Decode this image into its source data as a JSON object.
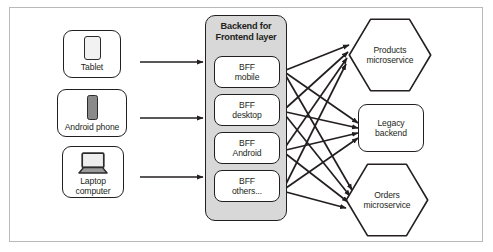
{
  "diagram": {
    "frame_border_color": "#b9b9b9",
    "line_color": "#231f20",
    "layer_fill": "#d8d8d8"
  },
  "clients": [
    {
      "label": "Tablet",
      "icon": "tablet-icon"
    },
    {
      "label": "Android phone",
      "icon": "smartphone-icon"
    },
    {
      "label": "Laptop\ncomputer",
      "icon": "laptop-icon"
    }
  ],
  "bff_layer": {
    "title": "Backend for\nFrontend layer",
    "boxes": [
      {
        "label": "BFF\nmobile"
      },
      {
        "label": "BFF\ndesktop"
      },
      {
        "label": "BFF\nAndroid"
      },
      {
        "label": "BFF\nothers..."
      }
    ]
  },
  "services": [
    {
      "label": "Products\nmicroservice",
      "shape": "hexagon"
    },
    {
      "label": "Legacy\nbackend",
      "shape": "rounded-rectangle"
    },
    {
      "label": "Orders\nmicroservice",
      "shape": "hexagon"
    }
  ],
  "connections": {
    "client_to_layer": [
      {
        "from": "Tablet",
        "to": "Backend for Frontend layer"
      },
      {
        "from": "Android phone",
        "to": "Backend for Frontend layer"
      },
      {
        "from": "Laptop computer",
        "to": "Backend for Frontend layer"
      }
    ],
    "bff_to_service": [
      {
        "from": "BFF mobile",
        "to": "Products microservice"
      },
      {
        "from": "BFF mobile",
        "to": "Legacy backend"
      },
      {
        "from": "BFF mobile",
        "to": "Orders microservice"
      },
      {
        "from": "BFF desktop",
        "to": "Products microservice"
      },
      {
        "from": "BFF desktop",
        "to": "Legacy backend"
      },
      {
        "from": "BFF desktop",
        "to": "Orders microservice"
      },
      {
        "from": "BFF Android",
        "to": "Products microservice"
      },
      {
        "from": "BFF Android",
        "to": "Legacy backend"
      },
      {
        "from": "BFF Android",
        "to": "Orders microservice"
      },
      {
        "from": "BFF others...",
        "to": "Products microservice"
      },
      {
        "from": "BFF others...",
        "to": "Legacy backend"
      },
      {
        "from": "BFF others...",
        "to": "Orders microservice"
      }
    ]
  }
}
